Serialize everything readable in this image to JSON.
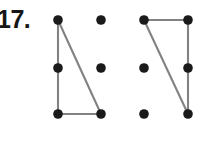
{
  "page": {
    "width": 211,
    "height": 142,
    "background_color": "#ffffff"
  },
  "problem": {
    "number_label": "17.",
    "label_color": "#161616"
  },
  "style": {
    "dot_color": "#1a1a1a",
    "dot_radius": 4.8,
    "line_color": "#828282",
    "line_width": 2.1
  },
  "figures": [
    {
      "name": "left-triangle",
      "grid": {
        "columns_x": [
          58,
          101
        ],
        "rows_y": [
          20,
          68,
          114
        ],
        "dots": [
          {
            "name": "dot-r1c1",
            "x": 58,
            "y": 20,
            "on_shape": true
          },
          {
            "name": "dot-r1c2",
            "x": 101,
            "y": 20,
            "on_shape": false
          },
          {
            "name": "dot-r2c1",
            "x": 58,
            "y": 68,
            "on_shape": true
          },
          {
            "name": "dot-r2c2",
            "x": 101,
            "y": 68,
            "on_shape": false
          },
          {
            "name": "dot-r3c1",
            "x": 58,
            "y": 114,
            "on_shape": true
          },
          {
            "name": "dot-r3c2",
            "x": 101,
            "y": 114,
            "on_shape": true
          }
        ]
      },
      "edges": [
        {
          "name": "left-vertical-leg",
          "x1": 58,
          "y1": 20,
          "x2": 58,
          "y2": 114
        },
        {
          "name": "bottom-horizontal-leg",
          "x1": 58,
          "y1": 114,
          "x2": 101,
          "y2": 114
        },
        {
          "name": "hypotenuse",
          "x1": 58,
          "y1": 20,
          "x2": 101,
          "y2": 114
        }
      ]
    },
    {
      "name": "right-triangle",
      "grid": {
        "columns_x": [
          144,
          188
        ],
        "rows_y": [
          20,
          68,
          114
        ],
        "dots": [
          {
            "name": "dot-r1c1",
            "x": 144,
            "y": 20,
            "on_shape": true
          },
          {
            "name": "dot-r1c2",
            "x": 188,
            "y": 20,
            "on_shape": true
          },
          {
            "name": "dot-r2c1",
            "x": 144,
            "y": 68,
            "on_shape": false
          },
          {
            "name": "dot-r2c2",
            "x": 188,
            "y": 68,
            "on_shape": true
          },
          {
            "name": "dot-r3c1",
            "x": 144,
            "y": 114,
            "on_shape": false
          },
          {
            "name": "dot-r3c2",
            "x": 188,
            "y": 114,
            "on_shape": true
          }
        ]
      },
      "edges": [
        {
          "name": "top-horizontal-leg",
          "x1": 144,
          "y1": 20,
          "x2": 188,
          "y2": 20
        },
        {
          "name": "right-vertical-leg",
          "x1": 188,
          "y1": 20,
          "x2": 188,
          "y2": 114
        },
        {
          "name": "hypotenuse",
          "x1": 144,
          "y1": 20,
          "x2": 188,
          "y2": 114
        }
      ]
    }
  ]
}
